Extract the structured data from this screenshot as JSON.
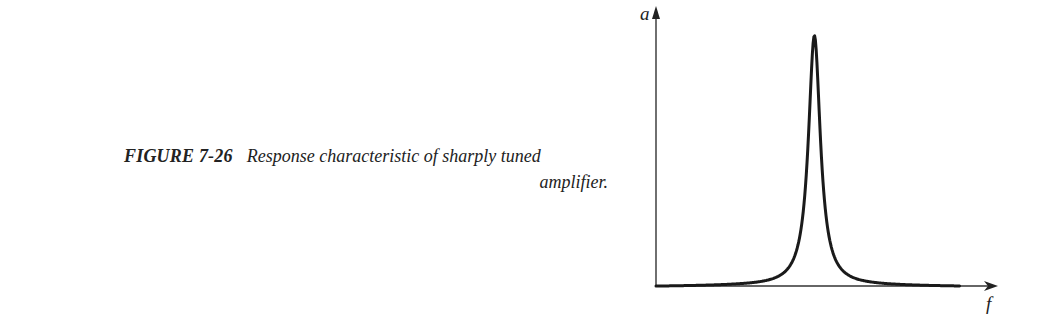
{
  "figure": {
    "label": "FIGURE 7-26",
    "caption_line1": "Response characteristic of sharply tuned",
    "caption_line2": "amplifier."
  },
  "chart_data": {
    "type": "line",
    "title": "Response characteristic of sharply tuned amplifier",
    "xlabel": "f",
    "ylabel": "a",
    "grid": false,
    "legend": "none",
    "x_ticks": [],
    "y_ticks": [],
    "xlim": [
      0,
      1
    ],
    "ylim": [
      0,
      1.07
    ],
    "series": [
      {
        "name": "response",
        "description": "sharply peaked resonance curve centered near f = 0.48 of the axis span, peak amplitude 1.0, approaching 0 at both ends",
        "x": [
          0.0,
          0.1,
          0.2,
          0.3,
          0.35,
          0.4,
          0.43,
          0.45,
          0.46,
          0.47,
          0.48,
          0.49,
          0.5,
          0.51,
          0.53,
          0.56,
          0.61,
          0.66,
          0.76,
          0.86,
          0.92
        ],
        "y": [
          0.0,
          0.005,
          0.02,
          0.05,
          0.08,
          0.15,
          0.26,
          0.45,
          0.7,
          0.93,
          1.0,
          0.93,
          0.7,
          0.45,
          0.26,
          0.15,
          0.08,
          0.05,
          0.02,
          0.005,
          0.0
        ]
      }
    ],
    "color": "#1a1a1a"
  }
}
